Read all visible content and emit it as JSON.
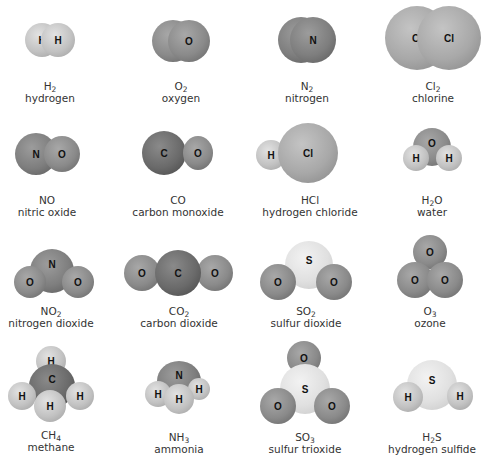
{
  "figure": {
    "molecules": [
      {
        "formula": "H",
        "sub": "2",
        "rest": "",
        "name": "hydrogen",
        "atoms": [
          "H",
          "H"
        ]
      },
      {
        "formula": "O",
        "sub": "2",
        "rest": "",
        "name": "oxygen",
        "atoms": [
          "O",
          "O"
        ]
      },
      {
        "formula": "N",
        "sub": "2",
        "rest": "",
        "name": "nitrogen",
        "atoms": [
          "N",
          "N"
        ]
      },
      {
        "formula": "Cl",
        "sub": "2",
        "rest": "",
        "name": "chlorine",
        "atoms": [
          "Cl",
          "Cl"
        ]
      },
      {
        "formula": "NO",
        "sub": "",
        "rest": "",
        "name": "nitric oxide",
        "atoms": [
          "N",
          "O"
        ]
      },
      {
        "formula": "CO",
        "sub": "",
        "rest": "",
        "name": "carbon monoxide",
        "atoms": [
          "C",
          "O"
        ]
      },
      {
        "formula": "HCl",
        "sub": "",
        "rest": "",
        "name": "hydrogen chloride",
        "atoms": [
          "H",
          "Cl"
        ]
      },
      {
        "formula": "H",
        "sub": "2",
        "rest": "O",
        "name": "water",
        "atoms": [
          "O",
          "H",
          "H"
        ]
      },
      {
        "formula": "NO",
        "sub": "2",
        "rest": "",
        "name": "nitrogen dioxide",
        "atoms": [
          "N",
          "O",
          "O"
        ]
      },
      {
        "formula": "CO",
        "sub": "2",
        "rest": "",
        "name": "carbon dioxide",
        "atoms": [
          "O",
          "C",
          "O"
        ]
      },
      {
        "formula": "SO",
        "sub": "2",
        "rest": "",
        "name": "sulfur dioxide",
        "atoms": [
          "S",
          "O",
          "O"
        ]
      },
      {
        "formula": "O",
        "sub": "3",
        "rest": "",
        "name": "ozone",
        "atoms": [
          "O",
          "O",
          "O"
        ]
      },
      {
        "formula": "CH",
        "sub": "4",
        "rest": "",
        "name": "methane",
        "atoms": [
          "H",
          "C",
          "H",
          "H",
          "H"
        ]
      },
      {
        "formula": "NH",
        "sub": "3",
        "rest": "",
        "name": "ammonia",
        "atoms": [
          "N",
          "H",
          "H",
          "H"
        ]
      },
      {
        "formula": "SO",
        "sub": "3",
        "rest": "",
        "name": "sulfur trioxide",
        "atoms": [
          "O",
          "S",
          "O",
          "O"
        ]
      },
      {
        "formula": "H",
        "sub": "2",
        "rest": "S",
        "name": "hydrogen sulfide",
        "atoms": [
          "S",
          "H",
          "H"
        ]
      }
    ]
  },
  "colors": {
    "background": "#ffffff",
    "label_text": "#333333",
    "hydrogen": "#c2c2c2",
    "oxygen": "#8a8a8a",
    "nitrogen": "#7e7e7e",
    "carbon": "#6a6a6a",
    "chlorine": "#a8a8a8",
    "sulfur": "#e0e0e0"
  }
}
